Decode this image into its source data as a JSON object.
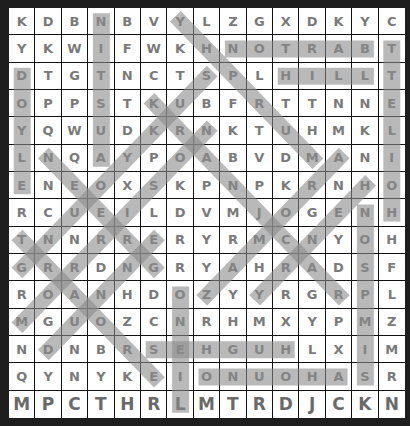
{
  "puzzle": {
    "rows": [
      [
        "K",
        "D",
        "B",
        "N",
        "B",
        "V",
        "Y",
        "L",
        "Z",
        "G",
        "X",
        "D",
        "K",
        "Y",
        "C"
      ],
      [
        "Y",
        "K",
        "W",
        "I",
        "F",
        "W",
        "K",
        "H",
        "N",
        "O",
        "T",
        "R",
        "A",
        "B",
        "T"
      ],
      [
        "D",
        "T",
        "G",
        "T",
        "N",
        "C",
        "T",
        "S",
        "P",
        "L",
        "H",
        "I",
        "L",
        "L",
        "T"
      ],
      [
        "O",
        "P",
        "P",
        "S",
        "T",
        "K",
        "U",
        "B",
        "F",
        "R",
        "T",
        "T",
        "N",
        "N",
        "E"
      ],
      [
        "Y",
        "Q",
        "W",
        "U",
        "D",
        "K",
        "R",
        "N",
        "K",
        "T",
        "U",
        "H",
        "M",
        "K",
        "L"
      ],
      [
        "L",
        "N",
        "Q",
        "A",
        "Y",
        "P",
        "O",
        "A",
        "B",
        "V",
        "D",
        "M",
        "A",
        "N",
        "I"
      ],
      [
        "E",
        "N",
        "E",
        "O",
        "X",
        "S",
        "K",
        "P",
        "N",
        "P",
        "K",
        "R",
        "N",
        "H",
        "O"
      ],
      [
        "R",
        "C",
        "U",
        "E",
        "I",
        "L",
        "D",
        "V",
        "M",
        "J",
        "O",
        "G",
        "E",
        "N",
        "H"
      ],
      [
        "T",
        "N",
        "N",
        "R",
        "R",
        "E",
        "R",
        "Y",
        "R",
        "M",
        "C",
        "N",
        "Y",
        "O",
        "H"
      ],
      [
        "G",
        "R",
        "R",
        "D",
        "N",
        "G",
        "R",
        "Y",
        "A",
        "H",
        "R",
        "A",
        "D",
        "S",
        "F"
      ],
      [
        "R",
        "O",
        "A",
        "N",
        "H",
        "D",
        "O",
        "Z",
        "Y",
        "Y",
        "R",
        "G",
        "R",
        "P",
        "L"
      ],
      [
        "M",
        "G",
        "U",
        "O",
        "Z",
        "C",
        "N",
        "R",
        "H",
        "M",
        "X",
        "Y",
        "P",
        "M",
        "Z"
      ],
      [
        "N",
        "D",
        "N",
        "B",
        "R",
        "S",
        "E",
        "H",
        "G",
        "U",
        "H",
        "L",
        "X",
        "I",
        "M"
      ],
      [
        "Q",
        "Y",
        "N",
        "Y",
        "K",
        "E",
        "I",
        "O",
        "N",
        "U",
        "O",
        "H",
        "A",
        "S",
        "R"
      ],
      [
        "M",
        "P",
        "C",
        "T",
        "H",
        "R",
        "L",
        "M",
        "T",
        "R",
        "D",
        "J",
        "C",
        "K",
        "N"
      ]
    ],
    "found_words": [
      {
        "word": "AUSTIN",
        "start": [
          5,
          3
        ],
        "end": [
          0,
          3
        ]
      },
      {
        "word": "BARTON",
        "start": [
          1,
          13
        ],
        "end": [
          1,
          8
        ]
      },
      {
        "word": "HILL",
        "start": [
          2,
          10
        ],
        "end": [
          2,
          13
        ]
      },
      {
        "word": "HOILETT",
        "start": [
          7,
          14
        ],
        "end": [
          1,
          14
        ]
      },
      {
        "word": "DOYLE",
        "start": [
          2,
          0
        ],
        "end": [
          6,
          0
        ]
      },
      {
        "word": "MURPHY",
        "start": [
          5,
          11
        ],
        "end": [
          0,
          6
        ]
      },
      {
        "word": "KRANJCAR",
        "start": [
          3,
          5
        ],
        "end": [
          10,
          12
        ]
      },
      {
        "word": "GREEN",
        "start": [
          9,
          5
        ],
        "end": [
          5,
          1
        ]
      },
      {
        "word": "MORRISON",
        "start": [
          11,
          0
        ],
        "end": [
          4,
          7
        ]
      },
      {
        "word": "GNUOYKUS",
        "start": [
          9,
          0
        ],
        "end": [
          2,
          7
        ]
      },
      {
        "word": "TRAORE",
        "start": [
          8,
          0
        ],
        "end": [
          13,
          5
        ]
      },
      {
        "word": "DUNNE",
        "start": [
          12,
          1
        ],
        "end": [
          8,
          5
        ]
      },
      {
        "word": "ZAMORA",
        "start": [
          10,
          7
        ],
        "end": [
          5,
          12
        ]
      },
      {
        "word": "HENRY",
        "start": [
          6,
          13
        ],
        "end": [
          10,
          9
        ]
      },
      {
        "word": "SIMPSON",
        "start": [
          13,
          13
        ],
        "end": [
          7,
          13
        ]
      },
      {
        "word": "ONEIL",
        "start": [
          10,
          6
        ],
        "end": [
          14,
          6
        ]
      },
      {
        "word": "HUGHES",
        "start": [
          12,
          10
        ],
        "end": [
          12,
          5
        ]
      },
      {
        "word": "ONUOHA",
        "start": [
          13,
          7
        ],
        "end": [
          13,
          12
        ]
      }
    ],
    "highlight_color": "#8a8a8a"
  }
}
